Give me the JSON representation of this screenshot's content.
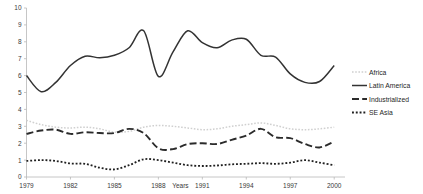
{
  "chart_data": {
    "type": "line",
    "title": "",
    "xlabel": "Years",
    "ylabel": "",
    "xlim": [
      1979,
      2000.6
    ],
    "ylim": [
      0,
      10
    ],
    "grid": false,
    "legend_position": "right",
    "x_ticks": [
      "1979",
      "1982",
      "1985",
      "1988",
      "1991",
      "1994",
      "1997",
      "2000"
    ],
    "x_tick_values": [
      1979,
      1982,
      1985,
      1988,
      1991,
      1994,
      1997,
      2000
    ],
    "y_ticks": [
      "0",
      "1",
      "2",
      "3",
      "4",
      "5",
      "6",
      "7",
      "8",
      "9",
      "10"
    ],
    "y_tick_values": [
      0,
      1,
      2,
      3,
      4,
      5,
      6,
      7,
      8,
      9,
      10
    ],
    "x": [
      1979,
      1980,
      1981,
      1982,
      1983,
      1984,
      1985,
      1986,
      1987,
      1988,
      1989,
      1990,
      1991,
      1992,
      1993,
      1994,
      1995,
      1996,
      1997,
      1998,
      1999,
      2000
    ],
    "series": [
      {
        "name": "Africa",
        "style": "dotted-light",
        "color": "#d0d0d0",
        "values": [
          3.35,
          3.1,
          2.95,
          2.9,
          2.95,
          2.85,
          2.65,
          2.7,
          2.95,
          3.05,
          3.0,
          2.9,
          2.8,
          2.85,
          3.0,
          3.1,
          3.2,
          3.05,
          2.85,
          2.8,
          2.85,
          2.95
        ]
      },
      {
        "name": "Latin America",
        "style": "solid",
        "color": "#333333",
        "values": [
          6.0,
          5.05,
          5.6,
          6.6,
          7.15,
          7.05,
          7.2,
          7.65,
          8.65,
          5.95,
          7.4,
          8.65,
          7.95,
          7.65,
          8.1,
          8.15,
          7.2,
          7.1,
          6.1,
          5.6,
          5.65,
          6.6
        ]
      },
      {
        "name": "Industrialized",
        "style": "dashed",
        "color": "#2b2b2b",
        "values": [
          2.55,
          2.75,
          2.8,
          2.55,
          2.65,
          2.6,
          2.6,
          2.85,
          2.6,
          1.7,
          1.65,
          1.95,
          2.0,
          1.95,
          2.2,
          2.45,
          2.85,
          2.35,
          2.3,
          1.95,
          1.75,
          2.1
        ]
      },
      {
        "name": "SE Asia",
        "style": "dotted",
        "color": "#1f1f1f",
        "values": [
          0.95,
          1.0,
          0.95,
          0.8,
          0.78,
          0.55,
          0.45,
          0.7,
          1.05,
          1.0,
          0.85,
          0.7,
          0.65,
          0.68,
          0.75,
          0.78,
          0.82,
          0.78,
          0.85,
          1.0,
          0.85,
          0.7
        ]
      }
    ]
  },
  "legend": {
    "items": [
      {
        "label": "Africa"
      },
      {
        "label": "Latin America"
      },
      {
        "label": "Industrialized"
      },
      {
        "label": "SE Asia"
      }
    ]
  }
}
